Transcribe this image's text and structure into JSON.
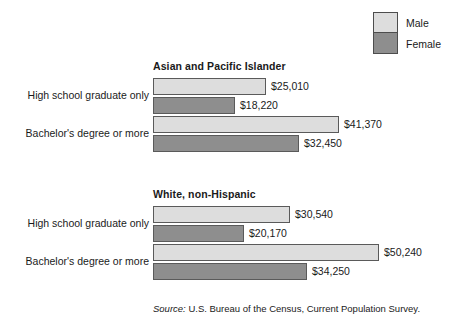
{
  "legend": {
    "items": [
      {
        "label": "Male",
        "color": "#dddddd",
        "key": "male"
      },
      {
        "label": "Female",
        "color": "#8e8e8e",
        "key": "female"
      }
    ]
  },
  "source": {
    "prefix": "Source:",
    "text": " U.S. Bureau of the Census, Current Population Survey."
  },
  "chart_data": {
    "type": "bar",
    "orientation": "horizontal",
    "title": "",
    "xlabel": "",
    "ylabel": "",
    "grid": false,
    "legend_position": "top-right",
    "series": [
      {
        "name": "Male",
        "color": "#dddddd"
      },
      {
        "name": "Female",
        "color": "#8e8e8e"
      }
    ],
    "axis_max": 56000,
    "groups": [
      {
        "title": "Asian and Pacific Islander",
        "categories": [
          {
            "label": "High school graduate only",
            "bars": [
              {
                "series": "Male",
                "value": 25010,
                "value_label": "$25,010"
              },
              {
                "series": "Female",
                "value": 18220,
                "value_label": "$18,220"
              }
            ]
          },
          {
            "label": "Bachelor's degree or more",
            "bars": [
              {
                "series": "Male",
                "value": 41370,
                "value_label": "$41,370"
              },
              {
                "series": "Female",
                "value": 32450,
                "value_label": "$32,450"
              }
            ]
          }
        ]
      },
      {
        "title": "White, non-Hispanic",
        "categories": [
          {
            "label": "High school graduate only",
            "bars": [
              {
                "series": "Male",
                "value": 30540,
                "value_label": "$30,540"
              },
              {
                "series": "Female",
                "value": 20170,
                "value_label": "$20,170"
              }
            ]
          },
          {
            "label": "Bachelor's degree or more",
            "bars": [
              {
                "series": "Male",
                "value": 50240,
                "value_label": "$50,240"
              },
              {
                "series": "Female",
                "value": 34250,
                "value_label": "$34,250"
              }
            ]
          }
        ]
      }
    ]
  }
}
